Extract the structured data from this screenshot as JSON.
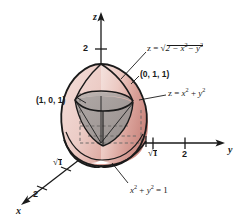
{
  "figure": {
    "kind": "3d-solid-region-diagram",
    "background": "#ffffff",
    "ink": "#1a1a1a",
    "colors": {
      "sphere_light": "#f2d9d4",
      "sphere_mid": "#e3b3ac",
      "sphere_dark": "#cf9189",
      "paraboloid_gray": "#9e9a99",
      "paraboloid_gray_light": "#b5b0ae",
      "outline": "#1a1a1a"
    },
    "axes": {
      "z": {
        "name": "z",
        "direction": "up",
        "ticks": [
          "2"
        ]
      },
      "y": {
        "name": "y",
        "direction": "right",
        "ticks": [
          "√2",
          "2"
        ]
      },
      "x": {
        "name": "x",
        "direction": "down-left",
        "ticks": [
          "√2",
          "2"
        ]
      }
    },
    "points": [
      {
        "id": "p-1-0-1",
        "label": "(1, 0, 1)"
      },
      {
        "id": "p-0-1-1",
        "label": "(0, 1, 1)"
      }
    ],
    "equations": [
      {
        "id": "sphere",
        "label": "z = √(2 − x² − y²)",
        "role": "upper-boundary-surface"
      },
      {
        "id": "paraboloid",
        "label": "z = x² + y²",
        "role": "lower-boundary-surface"
      },
      {
        "id": "circle",
        "label": "x² + y² = 1",
        "role": "intersection-curve"
      }
    ],
    "tick_labels": {
      "z_two": "2",
      "y_sqrt2": "√2",
      "y_two": "2",
      "x_sqrt2": "√2",
      "x_two": "2"
    },
    "axis_names": {
      "x": "x",
      "y": "y",
      "z": "z"
    },
    "radicands": {
      "sphere_inner": "2 − x",
      "sphere_inner_tail": "− y",
      "paraboloid_rhs_a": "x",
      "paraboloid_rhs_b": "y",
      "circle_lhs_a": "x",
      "circle_lhs_b": "y",
      "circle_rhs": "1"
    },
    "exponents": {
      "two": "2"
    },
    "operators": {
      "eq": "z =",
      "plus": "+",
      "minus": "−",
      "equals": "="
    }
  }
}
